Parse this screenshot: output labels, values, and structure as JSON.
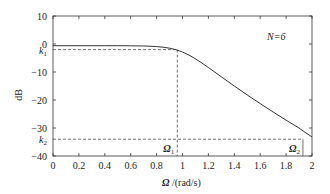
{
  "chart_data": {
    "type": "line",
    "title": "",
    "annotation": "N=6",
    "xlabel": "Ω /(rad/s)",
    "ylabel": "dB",
    "xlim": [
      0,
      2
    ],
    "ylim": [
      -40,
      10
    ],
    "xticks": [
      0,
      0.2,
      0.4,
      0.6,
      0.8,
      1,
      1.2,
      1.4,
      1.6,
      1.8,
      2
    ],
    "xtick_labels": [
      "0",
      "0.2",
      "0.4",
      "0.6",
      "0.8",
      "1",
      "1.2",
      "1.4",
      "1.6",
      "1.8",
      "2"
    ],
    "yticks": [
      10,
      0,
      -10,
      -20,
      -30,
      -40
    ],
    "ytick_labels": [
      "10",
      "0",
      "−10",
      "−20",
      "−30",
      "−40"
    ],
    "grid": false,
    "series": [
      {
        "name": "Butterworth N=6 magnitude response",
        "x": [
          0,
          0.1,
          0.2,
          0.3,
          0.4,
          0.5,
          0.6,
          0.7,
          0.75,
          0.8,
          0.85,
          0.9,
          0.95,
          1.0,
          1.05,
          1.1,
          1.15,
          1.2,
          1.3,
          1.4,
          1.5,
          1.6,
          1.7,
          1.8,
          1.9,
          1.93,
          2.0
        ],
        "values": [
          -0.6,
          -0.6,
          -0.6,
          -0.6,
          -0.6,
          -0.61,
          -0.63,
          -0.7,
          -0.78,
          -0.92,
          -1.15,
          -1.5,
          -2.05,
          -2.85,
          -3.95,
          -5.3,
          -6.8,
          -8.4,
          -11.7,
          -15.0,
          -18.2,
          -21.3,
          -24.3,
          -27.2,
          -30.0,
          -31.0,
          -33.2
        ]
      }
    ],
    "reference_lines": {
      "k1": {
        "label": "k1",
        "value_db": -2.0,
        "omega": 0.96,
        "omega_label": "Ω1"
      },
      "k2": {
        "label": "k2",
        "value_db": -34.0,
        "omega": 1.93,
        "omega_label": "Ω2"
      }
    }
  }
}
